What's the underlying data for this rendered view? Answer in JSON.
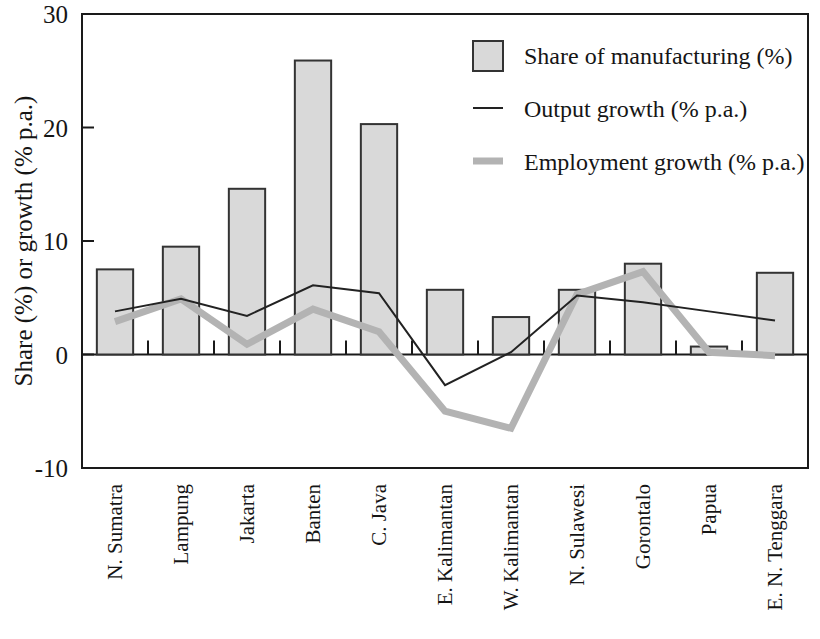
{
  "chart_data": {
    "type": "bar",
    "title": "",
    "xlabel": "",
    "ylabel": "Share (%) or growth (% p.a.)",
    "ylim": [
      -10,
      30
    ],
    "yticks": [
      30,
      20,
      10,
      0,
      -10
    ],
    "ytick_labels": [
      "30",
      "20",
      "10",
      "0",
      "-10"
    ],
    "grid": false,
    "legend_position": "top-right",
    "categories": [
      "N. Sumatra",
      "Lampung",
      "Jakarta",
      "Banten",
      "C. Java",
      "E. Kalimantan",
      "W. Kalimantan",
      "N. Sulawesi",
      "Gorontalo",
      "Papua",
      "E. N. Tenggara"
    ],
    "series": [
      {
        "name": "Share of manufacturing (%)",
        "kind": "bar",
        "color": "#d9d9d9",
        "edge_color": "#333333",
        "values": [
          7.5,
          9.5,
          14.6,
          25.9,
          20.3,
          5.7,
          3.3,
          5.7,
          8.0,
          0.7,
          7.2
        ]
      },
      {
        "name": "Output growth (% p.a.)",
        "kind": "line",
        "color": "#222222",
        "width": 2,
        "values": [
          3.8,
          4.9,
          3.4,
          6.1,
          5.4,
          -2.7,
          0.2,
          5.2,
          4.6,
          3.8,
          3.0
        ]
      },
      {
        "name": "Employment growth (% p.a.)",
        "kind": "line",
        "color": "#b3b3b3",
        "width": 7,
        "values": [
          2.9,
          4.9,
          0.9,
          4.0,
          2.0,
          -5.0,
          -6.5,
          5.3,
          7.3,
          0.2,
          -0.1
        ]
      }
    ]
  },
  "legend": {
    "items": [
      {
        "label": "Share of manufacturing (%)",
        "marker": "swatch"
      },
      {
        "label": "Output growth (% p.a.)",
        "marker": "thin-line"
      },
      {
        "label": "Employment growth (% p.a.)",
        "marker": "thick-line"
      }
    ]
  },
  "colors": {
    "bar_fill": "#d9d9d9",
    "bar_edge": "#333333",
    "output_line": "#222222",
    "employment_line": "#b3b3b3",
    "axis": "#1a1a1a",
    "text": "#151515",
    "background": "#ffffff"
  }
}
